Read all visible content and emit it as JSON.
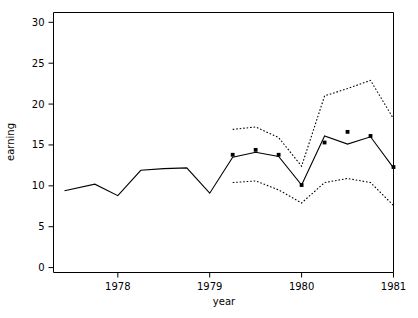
{
  "chart_data": {
    "type": "line",
    "title": "",
    "xlabel": "year",
    "ylabel": "earning",
    "xlim": [
      1977.3,
      1981.0
    ],
    "ylim": [
      -0.6,
      31.2
    ],
    "grid": false,
    "legend": null,
    "x_ticks": [
      1978,
      1979,
      1980,
      1981
    ],
    "x_tick_labels": [
      "1978",
      "1979",
      "1980",
      "1981"
    ],
    "y_ticks": [
      0,
      5,
      10,
      15,
      20,
      25,
      30
    ],
    "y_tick_labels": [
      "0",
      "5",
      "10",
      "15",
      "20",
      "25",
      "30"
    ],
    "series": [
      {
        "name": "fitted",
        "style": "solid",
        "x": [
          1977.42,
          1977.75,
          1978.0,
          1978.25,
          1978.5,
          1978.75,
          1979.0,
          1979.25,
          1979.5,
          1979.75,
          1980.0,
          1980.25,
          1980.5,
          1980.75,
          1981.0
        ],
        "values": [
          9.4,
          10.2,
          8.8,
          11.9,
          12.1,
          12.2,
          9.1,
          13.5,
          14.1,
          13.6,
          10.1,
          16.1,
          15.1,
          16.0,
          12.2
        ]
      },
      {
        "name": "upper-band",
        "style": "dotted",
        "x": [
          1979.25,
          1979.5,
          1979.75,
          1980.0,
          1980.25,
          1980.5,
          1980.75,
          1981.0
        ],
        "values": [
          16.9,
          17.2,
          15.9,
          12.4,
          21.0,
          21.9,
          22.9,
          18.2
        ]
      },
      {
        "name": "lower-band",
        "style": "dotted",
        "x": [
          1979.25,
          1979.5,
          1979.75,
          1980.0,
          1980.25,
          1980.5,
          1980.75,
          1981.0
        ],
        "values": [
          10.4,
          10.6,
          9.5,
          7.9,
          10.4,
          10.9,
          10.4,
          7.6
        ]
      }
    ],
    "points": {
      "name": "observed",
      "marker": "filled-square",
      "x": [
        1979.25,
        1979.5,
        1979.75,
        1980.0,
        1980.25,
        1980.5,
        1980.75,
        1981.0
      ],
      "values": [
        13.8,
        14.4,
        13.8,
        10.1,
        15.3,
        16.6,
        16.1,
        12.3
      ]
    },
    "colors": {
      "line": "#000000",
      "band": "#000000",
      "point": "#000000",
      "axis": "#000000",
      "background": "#ffffff"
    }
  }
}
